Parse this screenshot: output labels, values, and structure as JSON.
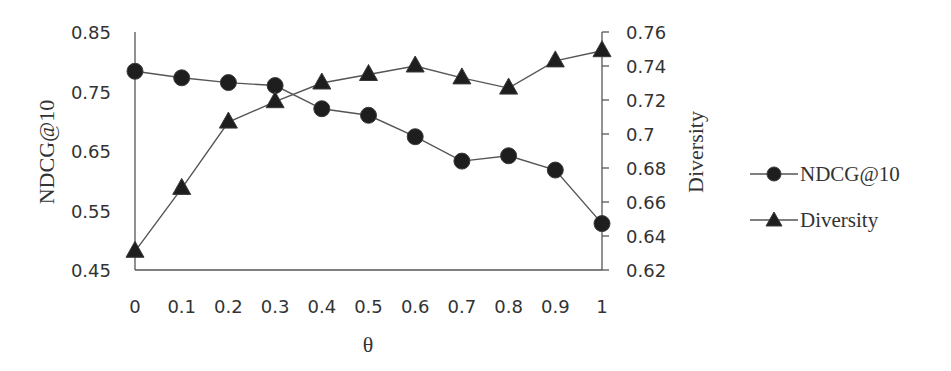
{
  "chart_data": {
    "type": "line",
    "title": "",
    "xlabel": "θ",
    "ylabel": "NDCG@10",
    "ylabel_right": "Diversity",
    "x": [
      0,
      0.1,
      0.2,
      0.3,
      0.4,
      0.5,
      0.6,
      0.7,
      0.8,
      0.9,
      1
    ],
    "x_tick_labels": [
      "0",
      "0.1",
      "0.2",
      "0.3",
      "0.4",
      "0.5",
      "0.6",
      "0.7",
      "0.8",
      "0.9",
      "1"
    ],
    "ylim": [
      0.45,
      0.85
    ],
    "y_tick_labels": [
      "0.85",
      "0.75",
      "0.65",
      "0.55",
      "0.45"
    ],
    "y_ticks": [
      0.85,
      0.75,
      0.65,
      0.55,
      0.45
    ],
    "ylim_right": [
      0.62,
      0.76
    ],
    "y_tick_labels_right": [
      "0.76",
      "0.74",
      "0.72",
      "0.7",
      "0.68",
      "0.66",
      "0.64",
      "0.62"
    ],
    "y_ticks_right": [
      0.76,
      0.74,
      0.72,
      0.7,
      0.68,
      0.66,
      0.64,
      0.62
    ],
    "grid": false,
    "legend_position": "right",
    "series": [
      {
        "name": "NDCG@10",
        "axis": "left",
        "marker": "circle",
        "values": [
          0.784,
          0.773,
          0.765,
          0.76,
          0.721,
          0.71,
          0.674,
          0.633,
          0.642,
          0.618,
          0.528
        ]
      },
      {
        "name": "Diversity",
        "axis": "right",
        "marker": "triangle",
        "values": [
          0.631,
          0.668,
          0.707,
          0.719,
          0.73,
          0.735,
          0.74,
          0.733,
          0.727,
          0.743,
          0.749
        ]
      }
    ]
  },
  "legend": {
    "items": [
      {
        "label": "NDCG@10",
        "marker": "circle-icon"
      },
      {
        "label": "Diversity",
        "marker": "triangle-icon"
      }
    ]
  },
  "colors": {
    "marker": "#1e1e1e",
    "line": "#555555",
    "text": "#333333"
  }
}
